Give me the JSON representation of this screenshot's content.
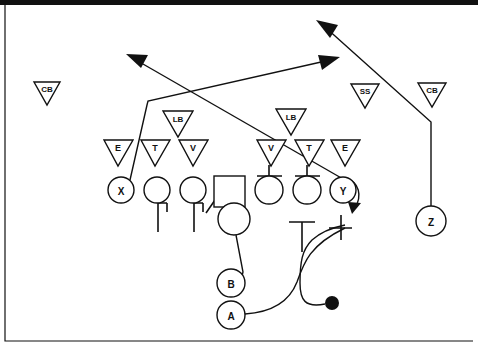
{
  "diagram": {
    "type": "american-football-play",
    "canvas": {
      "width": 478,
      "height": 347,
      "background": "#ffffff"
    },
    "stroke_color": "#111111",
    "fill_color": "#ffffff"
  },
  "defense": {
    "group_label": "Defense",
    "shape": "inverted-triangle",
    "players": [
      {
        "id": "cb-left",
        "label": "CB",
        "x": 47,
        "y": 93,
        "size": "small"
      },
      {
        "id": "lb-left",
        "label": "LB",
        "x": 178,
        "y": 122,
        "size": "small"
      },
      {
        "id": "lb-right",
        "label": "LB",
        "x": 291,
        "y": 120,
        "size": "small"
      },
      {
        "id": "ss",
        "label": "SS",
        "x": 365,
        "y": 95,
        "size": "small"
      },
      {
        "id": "cb-right",
        "label": "CB",
        "x": 432,
        "y": 94,
        "size": "small"
      },
      {
        "id": "dl-e-left",
        "label": "E",
        "x": 118,
        "y": 152,
        "size": "normal"
      },
      {
        "id": "dl-t-left",
        "label": "T",
        "x": 155,
        "y": 152,
        "size": "normal"
      },
      {
        "id": "dl-v-left",
        "label": "V",
        "x": 193,
        "y": 152,
        "size": "normal"
      },
      {
        "id": "dl-v-right",
        "label": "V",
        "x": 271,
        "y": 152,
        "size": "normal"
      },
      {
        "id": "dl-t-right",
        "label": "T",
        "x": 309,
        "y": 152,
        "size": "normal"
      },
      {
        "id": "dl-e-right",
        "label": "E",
        "x": 345,
        "y": 152,
        "size": "normal"
      }
    ]
  },
  "offense": {
    "group_label": "Offense",
    "players": [
      {
        "id": "x-receiver",
        "label": "X",
        "x": 121,
        "y": 190,
        "shape": "circle",
        "r": 13
      },
      {
        "id": "lineman-1",
        "label": "",
        "x": 157,
        "y": 190,
        "shape": "circle",
        "r": 13
      },
      {
        "id": "lineman-2",
        "label": "",
        "x": 193,
        "y": 190,
        "shape": "circle",
        "r": 13
      },
      {
        "id": "center",
        "label": "",
        "x": 229,
        "y": 191,
        "shape": "square",
        "size": 30
      },
      {
        "id": "lineman-3",
        "label": "",
        "x": 269,
        "y": 190,
        "shape": "circle",
        "r": 14
      },
      {
        "id": "lineman-4",
        "label": "",
        "x": 307,
        "y": 190,
        "shape": "circle",
        "r": 14
      },
      {
        "id": "y-receiver",
        "label": "Y",
        "x": 343,
        "y": 190,
        "shape": "circle",
        "r": 13
      },
      {
        "id": "z-receiver",
        "label": "Z",
        "x": 431,
        "y": 221,
        "shape": "circle",
        "r": 15
      },
      {
        "id": "quarterback",
        "label": "",
        "x": 234,
        "y": 219,
        "shape": "circle",
        "r": 16
      },
      {
        "id": "back-b",
        "label": "B",
        "x": 231,
        "y": 283,
        "shape": "circle",
        "r": 14
      },
      {
        "id": "back-a",
        "label": "A",
        "x": 231,
        "y": 315,
        "shape": "circle",
        "r": 14
      }
    ],
    "ball": {
      "id": "football",
      "label": "",
      "x": 332,
      "y": 303,
      "r": 7
    }
  },
  "routes": [
    {
      "id": "route-x-deep-in",
      "player": "X",
      "style": "arrow",
      "desc": "X runs up then breaks across to the right"
    },
    {
      "id": "route-y-deep-out",
      "player": "Y",
      "style": "arrow",
      "desc": "Y releases across the field to the left"
    },
    {
      "id": "route-z-post",
      "player": "Z",
      "style": "arrow",
      "desc": "Z runs straight up then breaks deep up-left"
    },
    {
      "id": "motion-ball",
      "player": "ball",
      "style": "curve",
      "desc": "Ball carrier path curving left then up"
    },
    {
      "id": "motion-a",
      "player": "A",
      "style": "curve",
      "desc": "A back sweeps right behind the line"
    },
    {
      "id": "motion-b",
      "player": "B",
      "style": "line",
      "desc": "B back to quarterback"
    },
    {
      "id": "block-y-arrow",
      "player": "Y",
      "style": "arrow-short",
      "desc": "Short hook arrow behind Y"
    }
  ],
  "blocks": [
    {
      "id": "block-lineman-1",
      "type": "pull-hook",
      "desc": "Lineman 1 pull block"
    },
    {
      "id": "block-lineman-2",
      "type": "pull-hook",
      "desc": "Lineman 2 pull block"
    },
    {
      "id": "block-dl-v-right",
      "type": "t-block",
      "desc": "Block on right V"
    },
    {
      "id": "block-dl-t-right",
      "type": "t-block",
      "desc": "Block on right T"
    },
    {
      "id": "block-center-lead",
      "type": "t-block",
      "desc": "Lead block marker"
    },
    {
      "id": "block-y-edge",
      "type": "t-block",
      "desc": "Edge block marker"
    }
  ]
}
